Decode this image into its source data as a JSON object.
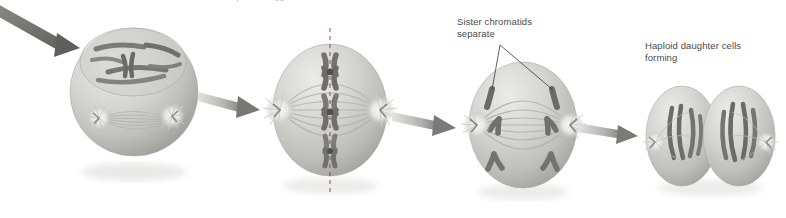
{
  "figure": {
    "kind": "biology-illustration",
    "title_cropped": "sperm or egg cells",
    "background_color": "#ffffff",
    "cell_fill_color": "#c9c9c6",
    "cell_shadow_color": "#8f8f8c",
    "chromosome_color": "#6e6e6b",
    "arrow_color": "#9a9a97",
    "arrow_dark_color": "#6b6b68",
    "metaphase_line_color": "#9c3b43",
    "label_text_color": "#4a4a4a",
    "leader_line_color": "#3a3a3a"
  },
  "labels": {
    "sister_chromatids": "Sister chromatids\nseparate",
    "haploid_daughter": "Haploid daughter cells\nforming"
  },
  "stages": [
    {
      "id": "stage-1",
      "name": "prophase-ii-cell",
      "caption": "",
      "chromosome_count": 4,
      "centrosomes": 2
    },
    {
      "id": "stage-2",
      "name": "metaphase-ii-cell",
      "caption": "",
      "chromosome_count": 3,
      "centrosomes": 2,
      "has_metaphase_plate": true
    },
    {
      "id": "stage-3",
      "name": "anaphase-ii-cell",
      "caption": "",
      "chromatid_pairs": 4,
      "centrosomes": 2
    },
    {
      "id": "stage-4",
      "name": "telophase-ii-daughter-cells",
      "caption": "",
      "daughter_cells": 2
    }
  ],
  "arrows": [
    {
      "id": "arrow-in",
      "name": "incoming-arrow",
      "direction": "down-right"
    },
    {
      "id": "arrow-1-2",
      "name": "arrow-stage1-stage2",
      "direction": "right"
    },
    {
      "id": "arrow-2-3",
      "name": "arrow-stage2-stage3",
      "direction": "right"
    },
    {
      "id": "arrow-3-4",
      "name": "arrow-stage3-stage4",
      "direction": "right"
    }
  ]
}
